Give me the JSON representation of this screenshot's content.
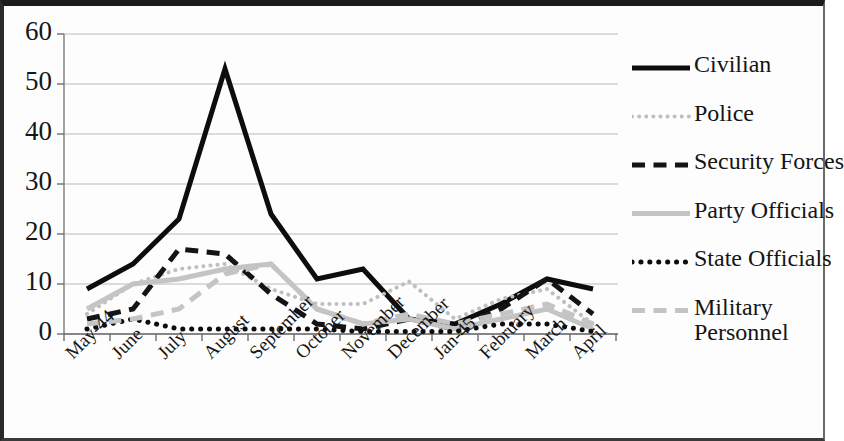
{
  "chart_data": {
    "type": "line",
    "title": "",
    "subtitle": "",
    "xlabel": "",
    "ylabel": "",
    "grid": true,
    "legend_position": "right",
    "ylim": [
      0,
      60
    ],
    "yticks": [
      0,
      10,
      20,
      30,
      40,
      50,
      60
    ],
    "ytick_labels": [
      "0",
      "10",
      "20",
      "30",
      "40",
      "50",
      "60"
    ],
    "categories": [
      "May-44",
      "June",
      "July",
      "August",
      "September",
      "October",
      "November",
      "December",
      "Jan-45",
      "February",
      "March",
      "April"
    ],
    "series": [
      {
        "name": "Civilian",
        "style": "solid",
        "color": "#0d0d0d",
        "width": 5,
        "values": [
          9,
          14,
          23,
          53,
          24,
          11,
          13,
          3,
          2,
          6,
          11,
          9
        ]
      },
      {
        "name": "Police",
        "style": "dotted",
        "color": "#bfbfbf",
        "width": 4,
        "values": [
          4,
          10,
          13,
          14,
          9,
          6,
          6,
          10.5,
          3,
          7,
          9,
          2
        ]
      },
      {
        "name": "Security Forces",
        "style": "dashed",
        "color": "#141414",
        "width": 5,
        "values": [
          3,
          5,
          17,
          16,
          8,
          2,
          1,
          3,
          1,
          5,
          11,
          4
        ]
      },
      {
        "name": "Party Officials",
        "style": "solid",
        "color": "#c4c4c4",
        "width": 5,
        "values": [
          5,
          10,
          11,
          13,
          14,
          5,
          2,
          3,
          1,
          3,
          5,
          1
        ]
      },
      {
        "name": "State Officials",
        "style": "dotted",
        "color": "#0d0d0d",
        "width": 5,
        "values": [
          1,
          3,
          1,
          1,
          1,
          1,
          0.5,
          0.5,
          0.5,
          2,
          2,
          0.5
        ]
      },
      {
        "name": "Military Personnel",
        "style": "dashed",
        "color": "#c4c4c4",
        "width": 5,
        "values": [
          2,
          3,
          5,
          12,
          14,
          5,
          2,
          4,
          2,
          4,
          6,
          2
        ]
      }
    ]
  },
  "legend": {
    "items": [
      {
        "label": "Civilian"
      },
      {
        "label": "Police"
      },
      {
        "label": "Security Forces"
      },
      {
        "label": "Party Officials"
      },
      {
        "label": "State Officials"
      },
      {
        "label": "Military Personnel"
      }
    ]
  }
}
